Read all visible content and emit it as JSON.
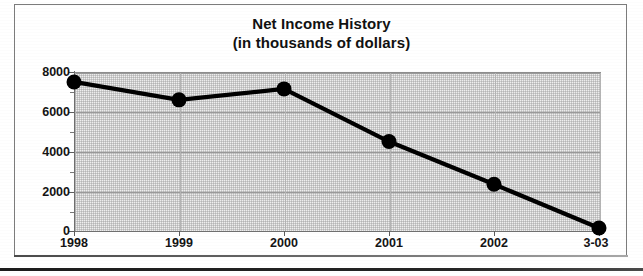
{
  "figure": {
    "title_line1": "Net Income History",
    "title_line2": "(in thousands of dollars)"
  },
  "chart_data": {
    "type": "line",
    "title": "Net Income History (in thousands of dollars)",
    "xlabel": "",
    "ylabel": "",
    "categories": [
      "1998",
      "1999",
      "2000",
      "2001",
      "2002",
      "3-03"
    ],
    "values": [
      7500,
      6600,
      7150,
      4500,
      2350,
      150
    ],
    "ylim": [
      0,
      8000
    ],
    "yticks": [
      0,
      2000,
      4000,
      6000,
      8000
    ],
    "ytick_labels": [
      "0",
      "2000",
      "4000",
      "6000",
      "8000"
    ],
    "yminor_interval": 1000,
    "grid": true,
    "legend": "none",
    "series": [
      {
        "name": "Net Income",
        "values": [
          7500,
          6600,
          7150,
          4500,
          2350,
          150
        ],
        "color": "#000000",
        "marker": "circle"
      }
    ]
  },
  "style": {
    "line_color": "#000000",
    "marker_color": "#000000",
    "plot_bg": "#efefef",
    "grid_color": "#9a9a9a",
    "frame_color": "#7c7c7c",
    "text_color": "#141414"
  }
}
